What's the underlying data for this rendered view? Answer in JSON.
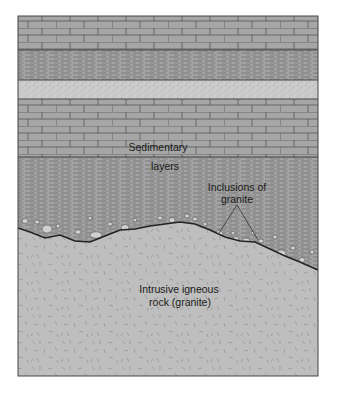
{
  "diagram": {
    "frame": {
      "x": 18,
      "y": 16,
      "width": 300,
      "height": 360
    },
    "colors": {
      "background": "#ffffff",
      "limestone": "#a6a6a6",
      "shale": "#a2a2a2",
      "sandstone": "#c9c9c9",
      "granite": "#bdbdbd",
      "line": "#333333",
      "pebble": "#cfcfcf"
    },
    "layers": [
      {
        "name": "limestone-upper",
        "pattern": "brick",
        "y_top": 16,
        "y_bottom": 50
      },
      {
        "name": "shale-upper",
        "pattern": "dashes",
        "y_top": 50,
        "y_bottom": 80
      },
      {
        "name": "sandstone",
        "pattern": "stipple",
        "y_top": 80,
        "y_bottom": 99
      },
      {
        "name": "limestone-middle",
        "pattern": "brick",
        "y_top": 99,
        "y_bottom": 157
      },
      {
        "name": "shale-lower",
        "pattern": "dashes",
        "y_top": 157,
        "y_bottom": "unconformity"
      },
      {
        "name": "granite",
        "pattern": "crystal-flecks",
        "y_top": "unconformity",
        "y_bottom": 376
      }
    ],
    "unconformity_points": [
      [
        18,
        228
      ],
      [
        30,
        232
      ],
      [
        45,
        238
      ],
      [
        60,
        235
      ],
      [
        75,
        241
      ],
      [
        90,
        242
      ],
      [
        105,
        236
      ],
      [
        120,
        230
      ],
      [
        135,
        229
      ],
      [
        150,
        226
      ],
      [
        165,
        224
      ],
      [
        180,
        222
      ],
      [
        195,
        224
      ],
      [
        210,
        230
      ],
      [
        225,
        237
      ],
      [
        240,
        241
      ],
      [
        255,
        242
      ],
      [
        270,
        249
      ],
      [
        285,
        256
      ],
      [
        300,
        262
      ],
      [
        318,
        270
      ]
    ],
    "labels": {
      "sedimentary_line1": "Sedimentary",
      "sedimentary_line2": "layers",
      "inclusions_line1": "Inclusions of",
      "inclusions_line2": "granite",
      "igneous_line1": "Intrusive igneous",
      "igneous_line2": "rock (granite)"
    },
    "pointer": {
      "apex": [
        237,
        205
      ],
      "left": [
        219,
        233
      ],
      "right": [
        258,
        240
      ]
    }
  }
}
